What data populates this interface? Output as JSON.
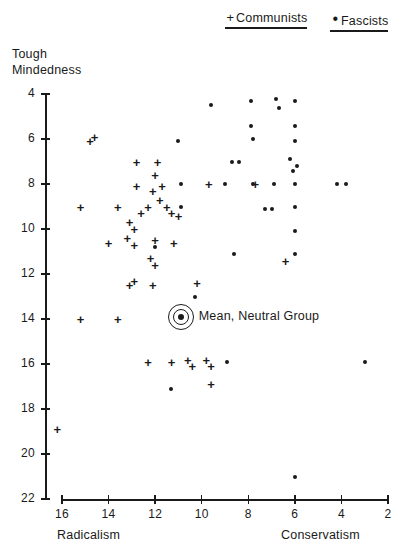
{
  "legend": {
    "communists": {
      "mark": "+",
      "label": "Communists"
    },
    "fascists": {
      "mark": "•",
      "label": "Fascists"
    }
  },
  "annotation": {
    "mean_label": "Mean, Neutral Group",
    "mean_marker_name": "bullseye-icon"
  },
  "chart_data": {
    "type": "scatter",
    "title": "",
    "xlabel_left": "Radicalism",
    "xlabel_right": "Conservatism",
    "ylabel": "Tough Mindedness",
    "xticks": [
      16,
      14,
      12,
      10,
      8,
      6,
      4,
      2
    ],
    "yticks": [
      4,
      6,
      8,
      10,
      12,
      14,
      16,
      18,
      20,
      22
    ],
    "xlim": [
      16,
      2
    ],
    "ylim": [
      4,
      22
    ],
    "x_axis_reversed": true,
    "grid": false,
    "legend_position": "top-right",
    "annotations": [
      {
        "label": "Mean, Neutral Group",
        "x": 10.9,
        "y": 13.9,
        "marker": "bullseye"
      }
    ],
    "series": [
      {
        "name": "Communists",
        "marker": "+",
        "points": [
          [
            14.8,
            6.1
          ],
          [
            14.6,
            5.9
          ],
          [
            12.8,
            7.0
          ],
          [
            11.9,
            7.0
          ],
          [
            12.0,
            7.6
          ],
          [
            12.1,
            8.3
          ],
          [
            11.7,
            8.1
          ],
          [
            12.8,
            8.1
          ],
          [
            11.8,
            8.7
          ],
          [
            9.7,
            8.0
          ],
          [
            7.7,
            8.0
          ],
          [
            15.2,
            9.0
          ],
          [
            13.6,
            9.0
          ],
          [
            12.3,
            9.0
          ],
          [
            11.5,
            9.0
          ],
          [
            11.3,
            9.3
          ],
          [
            12.6,
            9.3
          ],
          [
            11.0,
            9.4
          ],
          [
            13.1,
            9.7
          ],
          [
            12.9,
            10.0
          ],
          [
            13.2,
            10.4
          ],
          [
            12.9,
            10.7
          ],
          [
            12.0,
            10.5
          ],
          [
            11.2,
            10.6
          ],
          [
            14.0,
            10.6
          ],
          [
            12.2,
            11.3
          ],
          [
            12.0,
            11.6
          ],
          [
            6.4,
            11.4
          ],
          [
            13.1,
            12.5
          ],
          [
            12.9,
            12.3
          ],
          [
            12.1,
            12.5
          ],
          [
            10.2,
            12.4
          ],
          [
            15.2,
            14.0
          ],
          [
            13.6,
            14.0
          ],
          [
            12.3,
            15.9
          ],
          [
            11.3,
            15.9
          ],
          [
            10.6,
            15.8
          ],
          [
            10.4,
            16.1
          ],
          [
            9.8,
            15.8
          ],
          [
            9.6,
            16.1
          ],
          [
            9.6,
            16.9
          ],
          [
            16.2,
            18.9
          ]
        ]
      },
      {
        "name": "Fascists",
        "marker": "•",
        "points": [
          [
            9.6,
            4.5
          ],
          [
            7.9,
            4.3
          ],
          [
            6.8,
            4.2
          ],
          [
            6.7,
            4.6
          ],
          [
            6.0,
            4.3
          ],
          [
            7.9,
            5.4
          ],
          [
            6.0,
            5.4
          ],
          [
            11.0,
            6.1
          ],
          [
            7.8,
            6.0
          ],
          [
            6.0,
            6.1
          ],
          [
            8.7,
            7.0
          ],
          [
            8.4,
            7.0
          ],
          [
            6.2,
            6.9
          ],
          [
            5.9,
            7.2
          ],
          [
            6.1,
            7.4
          ],
          [
            10.9,
            8.0
          ],
          [
            9.0,
            8.0
          ],
          [
            7.8,
            8.0
          ],
          [
            6.9,
            8.0
          ],
          [
            6.0,
            8.0
          ],
          [
            4.2,
            8.0
          ],
          [
            3.8,
            8.0
          ],
          [
            10.9,
            9.0
          ],
          [
            7.3,
            9.1
          ],
          [
            7.0,
            9.1
          ],
          [
            6.0,
            9.0
          ],
          [
            6.0,
            10.1
          ],
          [
            12.0,
            10.8
          ],
          [
            8.6,
            11.1
          ],
          [
            6.0,
            11.1
          ],
          [
            10.3,
            13.0
          ],
          [
            8.9,
            15.9
          ],
          [
            3.0,
            15.9
          ],
          [
            11.3,
            17.1
          ],
          [
            6.0,
            21.0
          ]
        ]
      }
    ]
  }
}
